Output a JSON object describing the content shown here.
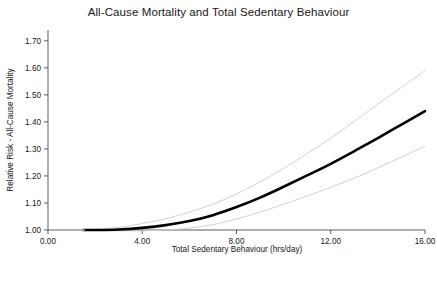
{
  "figure": {
    "title": "All-Cause Mortality and Total Sedentary Behaviour",
    "background_color": "#ffffff",
    "caption_cut_off": ""
  },
  "axes": {
    "x_label": "Total Sedentary Behaviour (hrs/day)",
    "y_label": "Relative Risk - All-Cause Mortality",
    "x_ticks": [
      "0.00",
      "4.00",
      "8.00",
      "12.00",
      "16.00"
    ],
    "y_ticks": [
      "1.00",
      "1.10",
      "1.20",
      "1.30",
      "1.40",
      "1.50",
      "1.60",
      "1.70"
    ]
  },
  "chart_data": {
    "type": "line",
    "title": "All-Cause Mortality and Total Sedentary Behaviour",
    "xlabel": "Total Sedentary Behaviour (hrs/day)",
    "ylabel": "Relative Risk - All-Cause Mortality",
    "xlim": [
      0.0,
      16.0
    ],
    "ylim": [
      1.0,
      1.74
    ],
    "xticks": [
      0.0,
      4.0,
      8.0,
      12.0,
      16.0
    ],
    "yticks": [
      1.0,
      1.1,
      1.2,
      1.3,
      1.4,
      1.5,
      1.6,
      1.7
    ],
    "grid": false,
    "legend": "none",
    "reference_point": {
      "x": 1.5,
      "y": 1.0,
      "label": "referent"
    },
    "x": [
      1.5,
      2.0,
      3.0,
      4.0,
      5.0,
      6.0,
      7.0,
      8.0,
      9.0,
      10.0,
      11.0,
      12.0,
      13.0,
      14.0,
      15.0,
      16.0
    ],
    "series": [
      {
        "name": "Relative Risk (central estimate)",
        "color": "#000000",
        "linewidth": 2.6,
        "values": [
          1.0,
          1.0,
          1.002,
          1.008,
          1.018,
          1.033,
          1.055,
          1.085,
          1.12,
          1.16,
          1.202,
          1.245,
          1.292,
          1.34,
          1.39,
          1.44
        ]
      },
      {
        "name": "95% CI upper",
        "color": "#cccccc",
        "linewidth": 0.9,
        "values": [
          1.0,
          1.002,
          1.01,
          1.024,
          1.042,
          1.066,
          1.096,
          1.133,
          1.178,
          1.228,
          1.283,
          1.34,
          1.402,
          1.466,
          1.528,
          1.59
        ]
      },
      {
        "name": "95% CI lower",
        "color": "#cccccc",
        "linewidth": 0.9,
        "values": [
          1.0,
          0.999,
          0.997,
          0.997,
          1.0,
          1.007,
          1.02,
          1.041,
          1.066,
          1.095,
          1.126,
          1.158,
          1.192,
          1.23,
          1.27,
          1.31
        ]
      }
    ]
  }
}
